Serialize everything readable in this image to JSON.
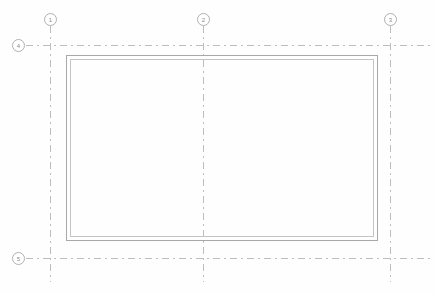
{
  "drawing": {
    "type": "architectural-floor-plan",
    "background_color": "#fefefe",
    "grid_line_color": "#bdbdbd",
    "wall_outer_color": "#a8a8a8",
    "wall_inner_color": "#c4c4c4",
    "bubble_text_color": "#8a8a8a",
    "bubble_border_color": "#b0b0b0"
  },
  "grid": {
    "vertical": [
      {
        "label": "1",
        "x": 50,
        "bubble_x": 44,
        "bubble_y": 13,
        "top": 26,
        "bottom": 282
      },
      {
        "label": "2",
        "x": 203,
        "bubble_x": 197,
        "bubble_y": 13,
        "top": 26,
        "bottom": 282
      },
      {
        "label": "3",
        "x": 390,
        "bubble_x": 384,
        "bubble_y": 13,
        "top": 26,
        "bottom": 282
      }
    ],
    "horizontal": [
      {
        "label": "4",
        "y": 45,
        "bubble_x": 12,
        "bubble_y": 39,
        "left": 26,
        "right": 433
      },
      {
        "label": "5",
        "y": 258,
        "bubble_x": 12,
        "bubble_y": 252,
        "left": 26,
        "right": 433
      }
    ]
  },
  "walls": {
    "outer": {
      "x": 66,
      "y": 55,
      "width": 312,
      "height": 186
    },
    "inner": {
      "x": 70,
      "y": 59,
      "width": 304,
      "height": 178
    }
  }
}
